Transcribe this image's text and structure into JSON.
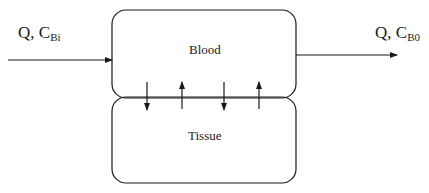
{
  "diagram": {
    "type": "two-compartment flow diagram",
    "inlet": {
      "flow": "Q",
      "separator": ", ",
      "conc": "C",
      "conc_sub": "Bi"
    },
    "outlet": {
      "flow": "Q",
      "separator": ", ",
      "conc": "C",
      "conc_sub": "B0"
    },
    "compartments": [
      {
        "label": "Blood"
      },
      {
        "label": "Tissue"
      }
    ],
    "exchange_arrows": [
      "down",
      "up",
      "down",
      "up"
    ],
    "colors": {
      "line": "#1a1a1a",
      "background": "#ffffff"
    }
  }
}
